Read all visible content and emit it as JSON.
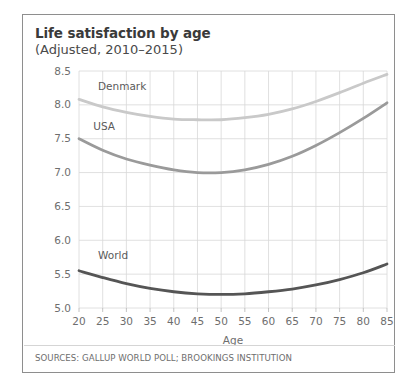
{
  "card": {
    "title": "Life satisfaction by age",
    "subtitle": "(Adjusted, 2010–2015)",
    "source": "SOURCES: GALLUP WORLD POLL; BROOKINGS INSTITUTION"
  },
  "chart_data": {
    "type": "line",
    "title": "Life satisfaction by age",
    "subtitle": "(Adjusted, 2010–2015)",
    "xlabel": "Age",
    "ylabel": "",
    "xlim": [
      20,
      85
    ],
    "ylim": [
      5.0,
      8.5
    ],
    "grid": true,
    "legend_position": "inline-labels",
    "xticks": [
      20,
      25,
      30,
      35,
      40,
      45,
      50,
      55,
      60,
      65,
      70,
      75,
      80,
      85
    ],
    "yticks": [
      "5.0",
      "5.5",
      "6.0",
      "6.5",
      "7.0",
      "7.5",
      "8.0",
      "8.5"
    ],
    "x": [
      20,
      25,
      30,
      35,
      40,
      45,
      50,
      55,
      60,
      65,
      70,
      75,
      80,
      85
    ],
    "series": [
      {
        "name": "Denmark",
        "color": "#c9c9c9",
        "values": [
          8.08,
          7.97,
          7.89,
          7.83,
          7.79,
          7.78,
          7.78,
          7.81,
          7.86,
          7.94,
          8.05,
          8.18,
          8.32,
          8.45
        ]
      },
      {
        "name": "USA",
        "color": "#9a9a9a",
        "values": [
          7.5,
          7.33,
          7.2,
          7.11,
          7.04,
          7.0,
          7.0,
          7.04,
          7.12,
          7.24,
          7.4,
          7.59,
          7.8,
          8.03
        ]
      },
      {
        "name": "World",
        "color": "#555555",
        "values": [
          5.55,
          5.45,
          5.36,
          5.29,
          5.24,
          5.21,
          5.2,
          5.21,
          5.24,
          5.28,
          5.34,
          5.42,
          5.52,
          5.65
        ]
      }
    ],
    "annotations": [
      {
        "text": "Denmark",
        "x": 24,
        "y": 8.22
      },
      {
        "text": "USA",
        "x": 23,
        "y": 7.63
      },
      {
        "text": "World",
        "x": 24,
        "y": 5.73
      }
    ]
  }
}
